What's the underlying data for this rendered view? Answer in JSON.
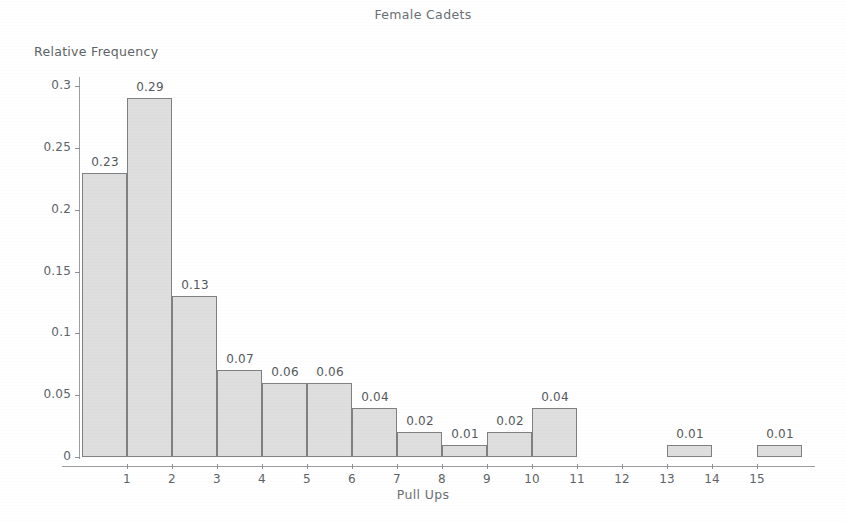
{
  "chart_data": {
    "type": "bar",
    "title": "Female Cadets",
    "xlabel": "Pull Ups",
    "ylabel": "Relative Frequency",
    "grid": false,
    "legend": "none",
    "xlim": [
      0,
      16.4
    ],
    "ylim": [
      0,
      0.315
    ],
    "xticks": [
      "1",
      "2",
      "3",
      "4",
      "5",
      "6",
      "7",
      "8",
      "9",
      "10",
      "11",
      "12",
      "13",
      "14",
      "15"
    ],
    "xtick_values": [
      1,
      2,
      3,
      4,
      5,
      6,
      7,
      8,
      9,
      10,
      11,
      12,
      13,
      14,
      15
    ],
    "yticks": [
      "0",
      "0.05",
      "0.1",
      "0.15",
      "0.2",
      "0.25",
      "0.3"
    ],
    "ytick_values": [
      0,
      0.05,
      0.1,
      0.15,
      0.2,
      0.25,
      0.3
    ],
    "bin_edges": [
      0,
      1,
      2,
      3,
      4,
      5,
      6,
      7,
      8,
      9,
      10,
      11,
      13,
      15
    ],
    "categories": [
      "0-1",
      "1-2",
      "2-3",
      "3-4",
      "4-5",
      "5-6",
      "6-7",
      "7-8",
      "8-9",
      "9-10",
      "10-11",
      "13-14",
      "15-16"
    ],
    "values": [
      0.23,
      0.29,
      0.13,
      0.07,
      0.06,
      0.06,
      0.04,
      0.02,
      0.01,
      0.02,
      0.04,
      0.01,
      0.01
    ],
    "bars": [
      {
        "x0": 0,
        "x1": 1,
        "value": 0.23,
        "label": "0.23"
      },
      {
        "x0": 1,
        "x1": 2,
        "value": 0.29,
        "label": "0.29"
      },
      {
        "x0": 2,
        "x1": 3,
        "value": 0.13,
        "label": "0.13"
      },
      {
        "x0": 3,
        "x1": 4,
        "value": 0.07,
        "label": "0.07"
      },
      {
        "x0": 4,
        "x1": 5,
        "value": 0.06,
        "label": "0.06"
      },
      {
        "x0": 5,
        "x1": 6,
        "value": 0.06,
        "label": "0.06"
      },
      {
        "x0": 6,
        "x1": 7,
        "value": 0.04,
        "label": "0.04"
      },
      {
        "x0": 7,
        "x1": 8,
        "value": 0.02,
        "label": "0.02"
      },
      {
        "x0": 8,
        "x1": 9,
        "value": 0.01,
        "label": "0.01"
      },
      {
        "x0": 9,
        "x1": 10,
        "value": 0.02,
        "label": "0.02"
      },
      {
        "x0": 10,
        "x1": 11,
        "value": 0.04,
        "label": "0.04"
      },
      {
        "x0": 13,
        "x1": 14,
        "value": 0.01,
        "label": "0.01"
      },
      {
        "x0": 15,
        "x1": 16,
        "value": 0.01,
        "label": "0.01"
      }
    ],
    "colors": {
      "bar_fill": "#dedede",
      "bar_border": "#7d8184",
      "axis": "#9a9ea1",
      "text": "#5e6367",
      "background": "#ffffff"
    }
  }
}
